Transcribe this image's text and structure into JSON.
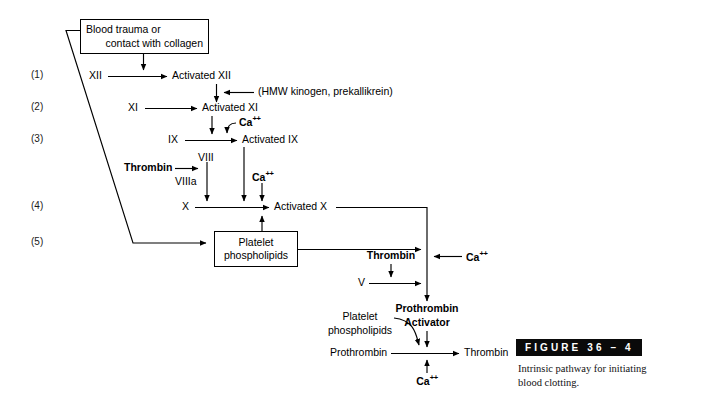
{
  "figure": {
    "bar_label": "FIGURE 36 – 4",
    "caption": "Intrinsic pathway for initiating blood clotting."
  },
  "diagram": {
    "title_box": {
      "line1": "Blood trauma or",
      "line2": "contact with collagen"
    },
    "platelet_box": {
      "line1": "Platelet",
      "line2": "phospholipids"
    },
    "steps": [
      {
        "n": "(1)"
      },
      {
        "n": "(2)"
      },
      {
        "n": "(3)"
      },
      {
        "n": "(4)"
      },
      {
        "n": "(5)"
      }
    ],
    "nodes": {
      "xii": "XII",
      "activated_xii": "Activated XII",
      "hmw": "(HMW kinogen, prekallikrein)",
      "xi": "XI",
      "activated_xi": "Activated XI",
      "ix": "IX",
      "activated_ix": "Activated IX",
      "viii": "VIII",
      "viiia": "VIIIa",
      "thrombin_viii": "Thrombin",
      "x": "X",
      "activated_x": "Activated X",
      "thrombin_v": "Thrombin",
      "v": "V",
      "prothrombin_activator_l1": "Prothrombin",
      "prothrombin_activator_l2": "Activator",
      "platelet_phospholipids_l1": "Platelet",
      "platelet_phospholipids_l2": "phospholipids",
      "prothrombin": "Prothrombin",
      "thrombin_out": "Thrombin",
      "ca_1": "Ca",
      "ca_1_sup": "++",
      "ca_2": "Ca",
      "ca_2_sup": "++",
      "ca_3": "Ca",
      "ca_3_sup": "++",
      "ca_4": "Ca",
      "ca_4_sup": "++"
    },
    "colors": {
      "ink": "#000000",
      "bar": "#0a0a0a",
      "background": "#ffffff"
    }
  }
}
